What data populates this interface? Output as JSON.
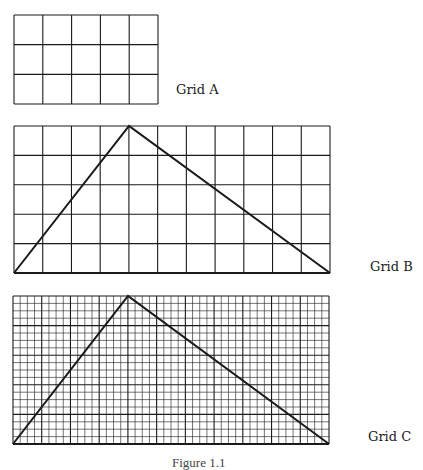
{
  "figure": {
    "caption": "Figure 1.1",
    "colors": {
      "line": "#1a1a1a",
      "background": "#ffffff",
      "text": "#222222"
    }
  },
  "grids": [
    {
      "id": "A",
      "label": "Grid A",
      "box": {
        "x": 14,
        "y": 15,
        "w": 144,
        "h": 89
      },
      "cols": 5,
      "rows": 3,
      "major_every": 1,
      "triangle": null,
      "label_pos": {
        "x": 176,
        "y": 83
      }
    },
    {
      "id": "B",
      "label": "Grid B",
      "box": {
        "x": 14,
        "y": 126,
        "w": 316,
        "h": 147
      },
      "cols": 11,
      "rows": 5,
      "major_every": 1,
      "triangle": {
        "left": [
          14,
          273
        ],
        "apex": [
          129,
          126
        ],
        "right": [
          330,
          273
        ]
      },
      "label_pos": {
        "x": 370,
        "y": 260
      }
    },
    {
      "id": "C",
      "label": "Grid C",
      "box": {
        "x": 13,
        "y": 296,
        "w": 316,
        "h": 148
      },
      "cols": 44,
      "rows": 20,
      "major_every": 4,
      "triangle": {
        "left": [
          13,
          444
        ],
        "apex": [
          128,
          296
        ],
        "right": [
          329,
          444
        ]
      },
      "label_pos": {
        "x": 368,
        "y": 430
      }
    }
  ]
}
